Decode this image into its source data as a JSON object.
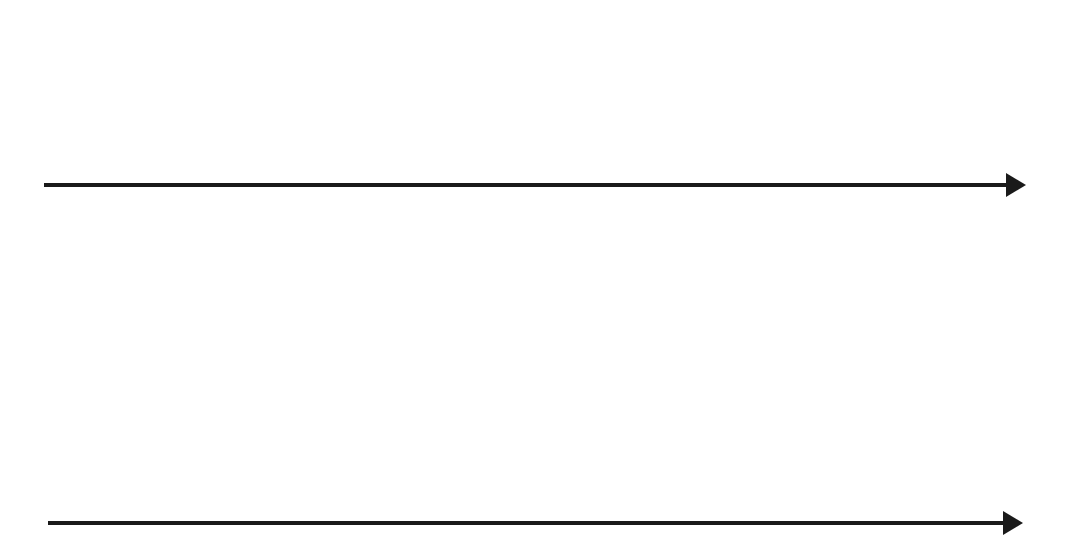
{
  "figure": {
    "background_color": "#ffffff",
    "line_color": "#1a1a1a",
    "fill_color": "#9a9a9a",
    "width": 1065,
    "height": 551
  },
  "chart_data": {
    "type": "bar",
    "xlabel": "",
    "ylabel": "",
    "grid": false,
    "legend": null,
    "panels": [
      {
        "name": "top-stem-panel",
        "type": "stem",
        "description": "Ten vertical stems crossing a horizontal axis; each stem has an up arrow above the axis, a gray rectangular box straddling the axis, and a wavy line ending in a down arrow below the axis.",
        "axis": {
          "y": 185,
          "x_start": 44,
          "x_end": 1025,
          "arrow": "right",
          "stroke_width": 4
        },
        "stem_count": 10,
        "stems": [
          {
            "index": 1,
            "x": 125,
            "up_arrow_top": 28,
            "box_top": 140,
            "box_bottom": 188,
            "box_height": 48,
            "down_arrow_tip": 287,
            "wave_start": 222,
            "wave_end": 268
          },
          {
            "index": 2,
            "x": 218,
            "up_arrow_top": 28,
            "box_top": 145,
            "box_bottom": 191,
            "box_height": 46,
            "down_arrow_tip": 296,
            "wave_start": 226,
            "wave_end": 274
          },
          {
            "index": 3,
            "x": 311,
            "up_arrow_top": 28,
            "box_top": 153,
            "box_bottom": 192,
            "box_height": 39,
            "down_arrow_tip": 306,
            "wave_start": 228,
            "wave_end": 282
          },
          {
            "index": 4,
            "x": 403,
            "up_arrow_top": 28,
            "box_top": 161,
            "box_bottom": 192,
            "box_height": 31,
            "down_arrow_tip": 318,
            "wave_start": 230,
            "wave_end": 292
          },
          {
            "index": 5,
            "x": 494,
            "up_arrow_top": 28,
            "box_top": 172,
            "box_bottom": 191,
            "box_height": 19,
            "down_arrow_tip": 327,
            "wave_start": 228,
            "wave_end": 300
          },
          {
            "index": 6,
            "x": 585,
            "up_arrow_top": 28,
            "box_top": 181,
            "box_bottom": 198,
            "box_height": 17,
            "down_arrow_tip": 334,
            "wave_start": 232,
            "wave_end": 308
          },
          {
            "index": 7,
            "x": 675,
            "up_arrow_top": 28,
            "box_top": 182,
            "box_bottom": 209,
            "box_height": 27,
            "down_arrow_tip": 344,
            "wave_start": 238,
            "wave_end": 317
          },
          {
            "index": 8,
            "x": 766,
            "up_arrow_top": 28,
            "box_top": 183,
            "box_bottom": 219,
            "box_height": 36,
            "down_arrow_tip": 352,
            "wave_start": 244,
            "wave_end": 325
          },
          {
            "index": 9,
            "x": 857,
            "up_arrow_top": 28,
            "box_top": 184,
            "box_bottom": 227,
            "box_height": 43,
            "down_arrow_tip": 358,
            "wave_start": 248,
            "wave_end": 331
          },
          {
            "index": 10,
            "x": 945,
            "up_arrow_top": 28,
            "box_top": 186,
            "box_bottom": 235,
            "box_height": 49,
            "down_arrow_tip": 362,
            "wave_start": 252,
            "wave_end": 335
          }
        ],
        "box_width": 22
      },
      {
        "name": "bottom-bar-panel",
        "type": "bar",
        "description": "Nine gray bars whose tops trace a dome-shaped dashed envelope curve above a horizontal baseline.",
        "baseline": {
          "y": 523,
          "x_start": 48,
          "x_end": 1022,
          "arrow": "right",
          "stroke_width": 4
        },
        "bar_width": 15,
        "categories": [
          "1",
          "2",
          "3",
          "4",
          "5",
          "6",
          "7",
          "8",
          "9"
        ],
        "bar_x": [
          117,
          212,
          299,
          391,
          483,
          574,
          666,
          760,
          850
        ],
        "bar_tops": [
          483,
          448,
          422,
          398,
          386,
          395,
          437,
          449,
          484
        ],
        "values": [
          40,
          75,
          101,
          125,
          137,
          128,
          86,
          74,
          39
        ],
        "ylim": [
          0,
          145
        ],
        "envelope": {
          "style": "dashed",
          "dash_pattern": "14 11",
          "x_start": 60,
          "x_end": 955,
          "peak_x": 487,
          "peak_y": 380,
          "baseline_y": 523
        }
      }
    ]
  }
}
